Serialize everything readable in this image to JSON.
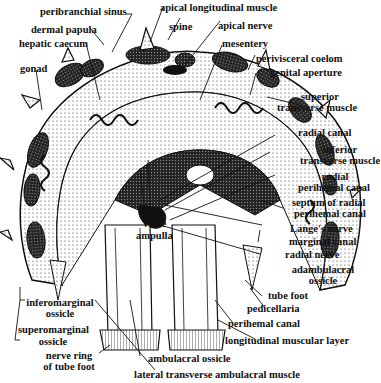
{
  "figure": {
    "labels": {
      "peribranchial_sinus": "peribranchial sinus",
      "apical_longitudinal_muscle": "apical longitudinal muscle",
      "dermal_papula": "dermal papula",
      "spine": "spine",
      "apical_nerve": "apical nerve",
      "hepatic_caecum": "hepatic caecum",
      "mesentery": "mesentery",
      "perivisceral_coelom": "perivisceral coelom",
      "gonad": "gonad",
      "genital_aperture": "genital aperture",
      "superior_transverse_muscle_1": "superior",
      "superior_transverse_muscle_2": "transverse muscle",
      "radial_canal": "radial canal",
      "inferior_transverse_muscle_1": "inferior",
      "inferior_transverse_muscle_2": "transverse muscle",
      "radial_perihemal_canal_1": "radial",
      "radial_perihemal_canal_2": "perihemal canal",
      "septum_1": "septum of radial",
      "septum_2": "perihemal canal",
      "langes_nerve": "Lange's nerve",
      "valve": "valve",
      "ampulla": "ampulla",
      "marginal_canal": "marginal canal",
      "radial_nerve": "radial nerve",
      "adambulacral_ossicle_1": "adambulacral",
      "adambulacral_ossicle_2": "ossicle",
      "tube_foot": "tube foot",
      "pedicellaria": "pedicellaria",
      "inferomarginal_ossicle_1": "inferomarginal",
      "inferomarginal_ossicle_2": "ossicle",
      "perihemal_canal": "perihemal canal",
      "longitudinal_muscular_layer": "longitudinal muscular layer",
      "superomarginal_ossicle_1": "superomarginal",
      "superomarginal_ossicle_2": "ossicle",
      "nerve_ring_1": "nerve ring",
      "nerve_ring_2": "of tube foot",
      "ambulacral_ossicle": "ambulacral ossicle",
      "lateral_transverse_ambulacral_muscle": "lateral transverse ambulacral muscle"
    }
  }
}
